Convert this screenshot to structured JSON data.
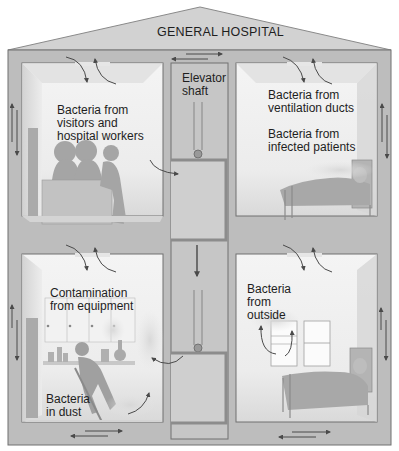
{
  "title": "GENERAL HOSPITAL",
  "colors": {
    "wall": "#b9b9b9",
    "wall_dark": "#8e8e8e",
    "outline": "#6b6b6b",
    "room_bg": "#e6e6e6",
    "room_light": "#f7f7f7",
    "figure": "#a9a9a9",
    "arrow": "#4a4a4a"
  },
  "rooms": [
    {
      "id": "upper-left",
      "label": "Bacteria from\nvisitors and\nhospital workers",
      "scene": "three visitors and a worker leaning at reception desk"
    },
    {
      "id": "upper-right",
      "label": "Bacteria from\nventilation ducts",
      "label2": "Bacteria from\ninfected patients",
      "scene": "patient lying in bed"
    },
    {
      "id": "lower-left",
      "label": "Contamination\nfrom equipment",
      "label2": "Bacteria\nin dust",
      "scene": "worker sweeping floor near cabinets with lab equipment"
    },
    {
      "id": "lower-right",
      "label": "Bacteria\nfrom\noutside",
      "scene": "open window and patient bed"
    }
  ],
  "elevator": {
    "label": "Elevator\nshaft"
  }
}
